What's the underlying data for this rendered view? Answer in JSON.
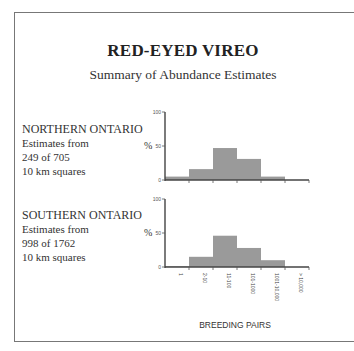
{
  "title": "RED-EYED VIREO",
  "subtitle": "Summary of Abundance Estimates",
  "regions": [
    {
      "name": "NORTHERN ONTARIO",
      "line1": "Estimates from",
      "line2": "249 of 705",
      "line3": "10 km squares"
    },
    {
      "name": "SOUTHERN ONTARIO",
      "line1": "Estimates from",
      "line2": "998 of 1762",
      "line3": "10 km squares"
    }
  ],
  "axis": {
    "y_label": "%",
    "y_ticks": [
      "100",
      "50",
      "0"
    ]
  },
  "x_axis_label": "BREEDING PAIRS",
  "chart_data": [
    {
      "type": "bar",
      "title": "NORTHERN ONTARIO",
      "categories": [
        "1",
        "2-10",
        "11-100",
        "101-1000",
        "1001-10,000",
        "> 10,000"
      ],
      "values": [
        5,
        16,
        47,
        31,
        5,
        0
      ],
      "xlabel": "BREEDING PAIRS",
      "ylabel": "%",
      "ylim": [
        0,
        100
      ],
      "grid": false,
      "bar_color": "#9a9a9a"
    },
    {
      "type": "bar",
      "title": "SOUTHERN ONTARIO",
      "categories": [
        "1",
        "2-10",
        "11-100",
        "101-1000",
        "1001-10,000",
        "> 10,000"
      ],
      "values": [
        1,
        15,
        46,
        28,
        10,
        0
      ],
      "xlabel": "BREEDING PAIRS",
      "ylabel": "%",
      "ylim": [
        0,
        100
      ],
      "grid": false,
      "bar_color": "#9a9a9a"
    }
  ]
}
